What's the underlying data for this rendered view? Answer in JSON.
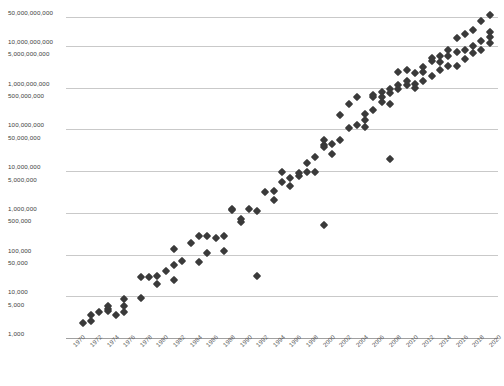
{
  "chart_data": {
    "type": "scatter",
    "title": "",
    "subtitle": "",
    "xlabel": "",
    "ylabel": "",
    "yscale": "log",
    "ylim": [
      1000,
      100000000000
    ],
    "xlim": [
      1969,
      2021
    ],
    "grid": true,
    "legend": null,
    "marker": {
      "shape": "diamond",
      "color": "#3a3a3a",
      "size_px": 6
    },
    "y_tick_labels": [
      "50,000,000,000",
      "10,000,000,000",
      "5,000,000,000",
      "1,000,000,000",
      "500,000,000",
      "100,000,000",
      "50,000,000",
      "10,000,000",
      "5,000,000",
      "1,000,000",
      "500,000",
      "100,000",
      "50,000",
      "10,000",
      "5,000",
      "1,000"
    ],
    "y_tick_values": [
      50000000000,
      10000000000,
      5000000000,
      1000000000,
      500000000,
      100000000,
      50000000,
      10000000,
      5000000,
      1000000,
      500000,
      100000,
      50000,
      10000,
      5000,
      1000
    ],
    "y_gridline_values": [
      50000000000,
      10000000000,
      1000000000,
      100000000,
      10000000,
      1000000,
      100000,
      10000,
      1000
    ],
    "x_tick_labels": [
      "1970",
      "1972",
      "1974",
      "1976",
      "1978",
      "1980",
      "1982",
      "1984",
      "1986",
      "1988",
      "1990",
      "1992",
      "1994",
      "1996",
      "1998",
      "2000",
      "2002",
      "2004",
      "2006",
      "2008",
      "2010",
      "2012",
      "2014",
      "2016",
      "2018",
      "2020"
    ],
    "x_tick_values": [
      1970,
      1972,
      1974,
      1976,
      1978,
      1980,
      1982,
      1984,
      1986,
      1988,
      1990,
      1992,
      1994,
      1996,
      1998,
      2000,
      2002,
      2004,
      2006,
      2008,
      2010,
      2012,
      2014,
      2016,
      2018,
      2020
    ],
    "points": [
      [
        1971,
        2300
      ],
      [
        1972,
        3500
      ],
      [
        1972,
        2500
      ],
      [
        1973,
        4100
      ],
      [
        1974,
        5000
      ],
      [
        1974,
        4500
      ],
      [
        1974,
        6000
      ],
      [
        1975,
        3510
      ],
      [
        1976,
        8500
      ],
      [
        1976,
        4300
      ],
      [
        1976,
        5800
      ],
      [
        1978,
        29000
      ],
      [
        1978,
        9000
      ],
      [
        1979,
        29000
      ],
      [
        1980,
        20000
      ],
      [
        1980,
        30000
      ],
      [
        1981,
        40000
      ],
      [
        1982,
        134000
      ],
      [
        1982,
        55000
      ],
      [
        1982,
        25000
      ],
      [
        1983,
        70000
      ],
      [
        1984,
        190000
      ],
      [
        1985,
        275000
      ],
      [
        1985,
        68000
      ],
      [
        1986,
        273000
      ],
      [
        1986,
        110000
      ],
      [
        1987,
        250000
      ],
      [
        1988,
        275000
      ],
      [
        1988,
        120000
      ],
      [
        1989,
        1180000
      ],
      [
        1989,
        1200000
      ],
      [
        1990,
        600000
      ],
      [
        1990,
        730000
      ],
      [
        1991,
        1200000
      ],
      [
        1992,
        1100000
      ],
      [
        1992,
        30000
      ],
      [
        1993,
        3100000
      ],
      [
        1994,
        2000000
      ],
      [
        1994,
        3300000
      ],
      [
        1995,
        5500000
      ],
      [
        1995,
        9300000
      ],
      [
        1996,
        4300000
      ],
      [
        1996,
        6900000
      ],
      [
        1997,
        7500000
      ],
      [
        1997,
        8800000
      ],
      [
        1998,
        9500000
      ],
      [
        1998,
        15200000
      ],
      [
        1999,
        21300000
      ],
      [
        1999,
        9500000
      ],
      [
        2000,
        42000000
      ],
      [
        2000,
        37500000
      ],
      [
        2000,
        54000000
      ],
      [
        2000,
        500000
      ],
      [
        2001,
        45000000
      ],
      [
        2001,
        25000000
      ],
      [
        2002,
        220000000
      ],
      [
        2002,
        55000000
      ],
      [
        2003,
        105000000
      ],
      [
        2003,
        410000000
      ],
      [
        2004,
        125000000
      ],
      [
        2004,
        592000000
      ],
      [
        2005,
        228000000
      ],
      [
        2005,
        112000000
      ],
      [
        2005,
        169000000
      ],
      [
        2006,
        291000000
      ],
      [
        2006,
        582000000
      ],
      [
        2006,
        681000000
      ],
      [
        2007,
        789000000
      ],
      [
        2007,
        463000000
      ],
      [
        2007,
        582000000
      ],
      [
        2008,
        731000000
      ],
      [
        2008,
        904000000
      ],
      [
        2008,
        411000000
      ],
      [
        2008,
        19000000
      ],
      [
        2009,
        1170000000
      ],
      [
        2009,
        904000000
      ],
      [
        2009,
        2300000000
      ],
      [
        2010,
        1170000000
      ],
      [
        2010,
        1400000000
      ],
      [
        2010,
        2600000000
      ],
      [
        2011,
        1200000000
      ],
      [
        2011,
        2270000000
      ],
      [
        2011,
        995000000
      ],
      [
        2012,
        1400000000
      ],
      [
        2012,
        3100000000
      ],
      [
        2012,
        2400000000
      ],
      [
        2013,
        1860000000
      ],
      [
        2013,
        4310000000
      ],
      [
        2013,
        5000000000
      ],
      [
        2014,
        2600000000
      ],
      [
        2014,
        4200000000
      ],
      [
        2014,
        5560000000
      ],
      [
        2015,
        3200000000
      ],
      [
        2015,
        5700000000
      ],
      [
        2015,
        8000000000
      ],
      [
        2016,
        3300000000
      ],
      [
        2016,
        7200000000
      ],
      [
        2016,
        15300000000
      ],
      [
        2017,
        4800000000
      ],
      [
        2017,
        19200000000
      ],
      [
        2017,
        8000000000
      ],
      [
        2018,
        6900000000
      ],
      [
        2018,
        10000000000
      ],
      [
        2018,
        23600000000
      ],
      [
        2019,
        8000000000
      ],
      [
        2019,
        13000000000
      ],
      [
        2019,
        39540000000
      ],
      [
        2020,
        11800000000
      ],
      [
        2020,
        21700000000
      ],
      [
        2020,
        54200000000
      ],
      [
        2020,
        16000000000
      ]
    ]
  },
  "footer": {
    "caption": ""
  },
  "colors": {
    "marker": "#3a3a3a",
    "gridline": "#c9c9c9",
    "axis": "#a0a0a0",
    "tick_text": "#5a5a5a",
    "background": "#ffffff"
  }
}
